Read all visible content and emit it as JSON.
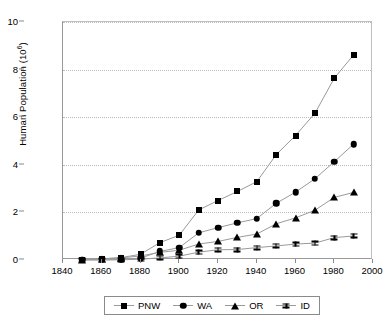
{
  "chart_data": {
    "type": "line",
    "title": "",
    "xlabel": "",
    "ylabel": "Human Population (10",
    "ylabel_sup": "6",
    "ylabel_suffix": ")",
    "xlim": [
      1840,
      2000
    ],
    "ylim": [
      0,
      10
    ],
    "x_ticks": [
      1840,
      1860,
      1880,
      1900,
      1920,
      1940,
      1960,
      1980,
      2000
    ],
    "y_ticks": [
      0,
      2,
      4,
      6,
      8,
      10
    ],
    "grid": "horizontal-dotted",
    "legend_position": "bottom-center",
    "x": [
      1850,
      1860,
      1870,
      1880,
      1890,
      1900,
      1910,
      1920,
      1930,
      1940,
      1950,
      1960,
      1970,
      1980,
      1990
    ],
    "series": [
      {
        "name": "PNW",
        "marker": "square",
        "values": [
          0.02,
          0.05,
          0.1,
          0.24,
          0.73,
          1.04,
          2.1,
          2.5,
          2.88,
          3.29,
          4.42,
          5.23,
          6.16,
          7.64,
          8.62
        ]
      },
      {
        "name": "WA",
        "marker": "circle",
        "values": [
          0.01,
          0.01,
          0.02,
          0.08,
          0.36,
          0.52,
          1.14,
          1.36,
          1.56,
          1.74,
          2.38,
          2.85,
          3.41,
          4.13,
          4.87
        ]
      },
      {
        "name": "OR",
        "marker": "triangle",
        "values": [
          0.01,
          0.05,
          0.09,
          0.17,
          0.32,
          0.41,
          0.67,
          0.78,
          0.95,
          1.09,
          1.52,
          1.77,
          2.09,
          2.63,
          2.84
        ]
      },
      {
        "name": "ID",
        "marker": "dumbbell",
        "values": [
          0.0,
          0.0,
          0.01,
          0.03,
          0.09,
          0.16,
          0.33,
          0.43,
          0.44,
          0.52,
          0.59,
          0.67,
          0.71,
          0.94,
          1.01
        ]
      }
    ]
  },
  "legend": {
    "items": [
      {
        "label": "PNW"
      },
      {
        "label": "WA"
      },
      {
        "label": "OR"
      },
      {
        "label": "ID"
      }
    ]
  }
}
